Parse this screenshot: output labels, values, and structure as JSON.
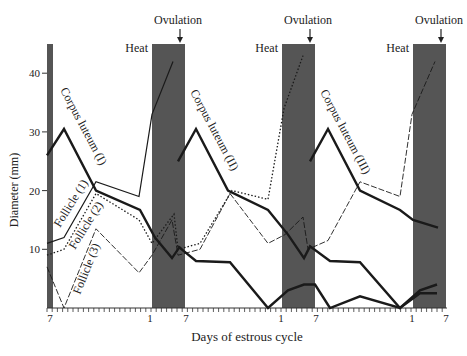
{
  "chart_data": {
    "type": "line",
    "title": "",
    "xlabel": "Days of estrous cycle",
    "ylabel": "Diameter (mm)",
    "ylim": [
      0,
      45
    ],
    "yticks": [
      10,
      20,
      30,
      40
    ],
    "xtick_labels": [
      {
        "label": "7",
        "px": 50
      },
      {
        "label": "1",
        "px": 150
      },
      {
        "label": "7",
        "px": 186
      },
      {
        "label": "1",
        "px": 281
      },
      {
        "label": "7",
        "px": 316
      },
      {
        "label": "1",
        "px": 412
      },
      {
        "label": "7",
        "px": 446
      }
    ],
    "heat_bands": [
      {
        "x0": 47,
        "x1": 53,
        "label": ""
      },
      {
        "x0": 152,
        "x1": 185,
        "label": "Heat"
      },
      {
        "x0": 282,
        "x1": 315,
        "label": "Heat"
      },
      {
        "x0": 413,
        "x1": 446,
        "label": "Heat"
      }
    ],
    "ovulation_markers": [
      {
        "label": "Ovulation",
        "px": 180
      },
      {
        "label": "Ovulation",
        "px": 310
      },
      {
        "label": "Ovulation",
        "px": 441
      }
    ],
    "series": [
      {
        "name": "Corpus luteum (I)",
        "style": "thick",
        "points": [
          [
            47,
            26
          ],
          [
            64,
            30.5
          ],
          [
            96,
            20
          ],
          [
            140,
            16.7
          ],
          [
            155,
            12
          ],
          [
            172,
            8.5
          ],
          [
            180,
            10.5
          ]
        ]
      },
      {
        "name": "Corpus luteum (II)",
        "style": "thick",
        "points": [
          [
            178,
            25
          ],
          [
            196,
            30.5
          ],
          [
            228,
            20
          ],
          [
            268,
            16.7
          ],
          [
            288,
            12.5
          ],
          [
            304,
            8.5
          ],
          [
            310,
            10.5
          ],
          [
            330,
            8
          ],
          [
            360,
            7.8
          ],
          [
            400,
            0
          ],
          [
            420,
            3
          ],
          [
            437,
            4
          ]
        ]
      },
      {
        "name": "Corpus luteum (III)",
        "style": "thick",
        "points": [
          [
            310,
            25
          ],
          [
            328,
            30.5
          ],
          [
            360,
            20
          ],
          [
            400,
            16.7
          ],
          [
            413,
            15
          ],
          [
            438,
            13.7
          ]
        ]
      },
      {
        "name": "Follicle (1)",
        "style": "solid-thin",
        "points": [
          [
            47,
            11
          ],
          [
            64,
            12
          ],
          [
            96,
            21.5
          ],
          [
            139,
            19
          ],
          [
            152,
            33
          ],
          [
            173,
            42
          ]
        ]
      },
      {
        "name": "Follicle (2)",
        "style": "dotted",
        "points": [
          [
            47,
            9
          ],
          [
            64,
            10
          ],
          [
            96,
            19.5
          ],
          [
            139,
            15
          ],
          [
            152,
            11
          ],
          [
            174,
            16
          ],
          [
            178,
            10
          ],
          [
            200,
            11
          ],
          [
            232,
            20
          ],
          [
            268,
            18.5
          ],
          [
            284,
            34
          ],
          [
            303,
            43
          ]
        ]
      },
      {
        "name": "Follicle (3)",
        "style": "dashed-thin",
        "points": [
          [
            47,
            7
          ],
          [
            64,
            0
          ],
          [
            96,
            13.5
          ],
          [
            139,
            6
          ],
          [
            152,
            9
          ],
          [
            172,
            15
          ],
          [
            178,
            9
          ],
          [
            200,
            10
          ],
          [
            230,
            19.5
          ],
          [
            268,
            11
          ],
          [
            285,
            12.5
          ],
          [
            303,
            15.5
          ],
          [
            308,
            10
          ],
          [
            328,
            11.5
          ],
          [
            360,
            21.5
          ],
          [
            400,
            19
          ],
          [
            412,
            33
          ],
          [
            435,
            42
          ]
        ]
      },
      {
        "name": "Corpus luteum (carry)",
        "style": "thick",
        "points": [
          [
            178,
            10.5
          ],
          [
            196,
            8
          ],
          [
            230,
            7.8
          ],
          [
            268,
            0
          ],
          [
            288,
            3
          ],
          [
            304,
            4
          ],
          [
            315,
            4
          ],
          [
            330,
            0
          ],
          [
            360,
            2
          ],
          [
            400,
            0
          ],
          [
            420,
            2.5
          ],
          [
            437,
            2.5
          ]
        ]
      }
    ],
    "annotations": [
      {
        "text": "Corpus luteum (I)",
        "x": 60,
        "y": 90,
        "rotate": 62
      },
      {
        "text": "Corpus luteum (II)",
        "x": 190,
        "y": 92,
        "rotate": 62
      },
      {
        "text": "Corpus luteum (III)",
        "x": 320,
        "y": 92,
        "rotate": 62
      },
      {
        "text": "Follicle (1)",
        "x": 60,
        "y": 228,
        "rotate": -58
      },
      {
        "text": "Follicle (2)",
        "x": 75,
        "y": 250,
        "rotate": -58
      },
      {
        "text": "Follicle (3)",
        "x": 80,
        "y": 295,
        "rotate": -68
      }
    ]
  },
  "labels": {
    "heat": "Heat",
    "ovulation": "Ovulation",
    "xlabel": "Days of estrous cycle",
    "ylabel": "Diameter (mm)"
  },
  "colors": {
    "band": "#555555",
    "line": "#1a1a1a"
  }
}
